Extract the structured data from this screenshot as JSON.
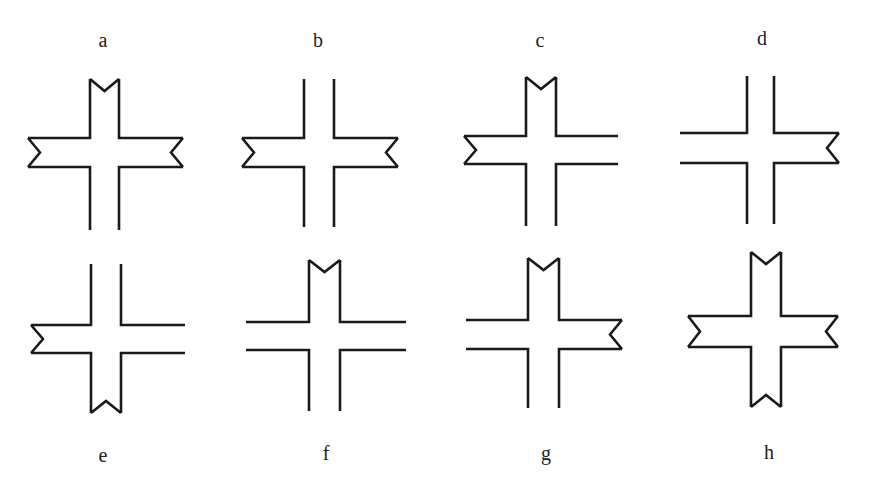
{
  "figure": {
    "stroke_color": "#1a1a1a",
    "background": "#ffffff"
  },
  "crosses": [
    {
      "label": "a",
      "label_pos": {
        "x": 103,
        "y": 30
      },
      "geometry": {
        "vx1": 90,
        "vx2": 119,
        "top": 79,
        "bottom": 230,
        "hy1": 138,
        "hy2": 167,
        "left": 28,
        "right": 183
      },
      "arms": {
        "top": "notched",
        "right": "notched",
        "bottom": "open",
        "left": "notched"
      }
    },
    {
      "label": "b",
      "label_pos": {
        "x": 318,
        "y": 30
      },
      "geometry": {
        "vx1": 304,
        "vx2": 334,
        "top": 79,
        "bottom": 227,
        "hy1": 138,
        "hy2": 167,
        "left": 242,
        "right": 398
      },
      "arms": {
        "top": "open",
        "right": "notched",
        "bottom": "open",
        "left": "notched"
      }
    },
    {
      "label": "c",
      "label_pos": {
        "x": 540,
        "y": 30
      },
      "geometry": {
        "vx1": 526,
        "vx2": 556,
        "top": 77,
        "bottom": 226,
        "hy1": 136,
        "hy2": 164,
        "left": 464,
        "right": 618
      },
      "arms": {
        "top": "notched",
        "right": "open",
        "bottom": "open",
        "left": "notched"
      }
    },
    {
      "label": "d",
      "label_pos": {
        "x": 762,
        "y": 28
      },
      "geometry": {
        "vx1": 747,
        "vx2": 774,
        "top": 76,
        "bottom": 224,
        "hy1": 133,
        "hy2": 163,
        "left": 680,
        "right": 839
      },
      "arms": {
        "top": "open",
        "right": "notched",
        "bottom": "open",
        "left": "open"
      }
    },
    {
      "label": "e",
      "label_pos": {
        "x": 103,
        "y": 445
      },
      "geometry": {
        "vx1": 91,
        "vx2": 121,
        "top": 264,
        "bottom": 413,
        "hy1": 325,
        "hy2": 353,
        "left": 31,
        "right": 185
      },
      "arms": {
        "top": "open",
        "right": "open",
        "bottom": "notched",
        "left": "notched"
      }
    },
    {
      "label": "f",
      "label_pos": {
        "x": 326,
        "y": 443
      },
      "geometry": {
        "vx1": 309,
        "vx2": 340,
        "top": 260,
        "bottom": 411,
        "hy1": 322,
        "hy2": 350,
        "left": 246,
        "right": 406
      },
      "arms": {
        "top": "notched",
        "right": "open",
        "bottom": "open",
        "left": "open"
      }
    },
    {
      "label": "g",
      "label_pos": {
        "x": 546,
        "y": 443
      },
      "geometry": {
        "vx1": 528,
        "vx2": 559,
        "top": 258,
        "bottom": 408,
        "hy1": 320,
        "hy2": 349,
        "left": 466,
        "right": 622
      },
      "arms": {
        "top": "notched",
        "right": "notched",
        "bottom": "open",
        "left": "open"
      }
    },
    {
      "label": "h",
      "label_pos": {
        "x": 769,
        "y": 442
      },
      "geometry": {
        "vx1": 751,
        "vx2": 781,
        "top": 252,
        "bottom": 407,
        "hy1": 316,
        "hy2": 347,
        "left": 688,
        "right": 838
      },
      "arms": {
        "top": "notched",
        "right": "notched",
        "bottom": "notched",
        "left": "notched"
      }
    }
  ]
}
